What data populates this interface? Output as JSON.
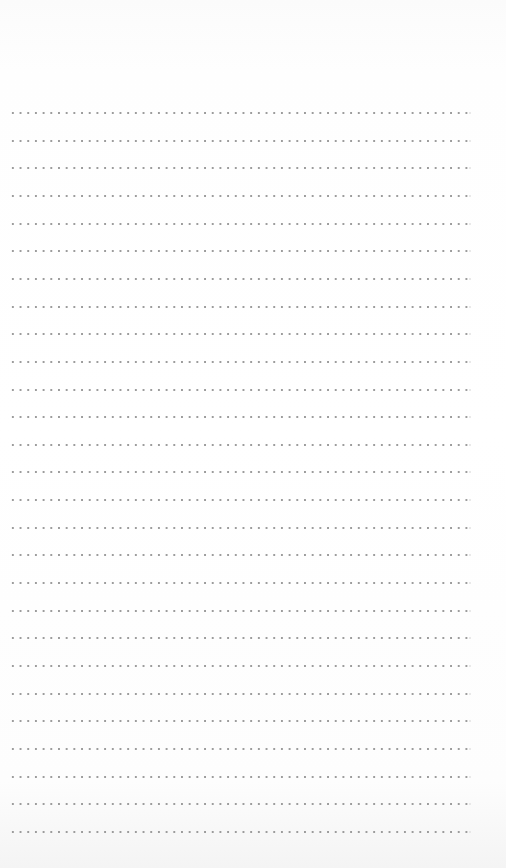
{
  "page": {
    "type": "dotted-ruled-notepad",
    "background_color": "#ffffff",
    "dot_color": "#9c9c9c",
    "line_count": 27,
    "first_line_y": 112,
    "line_spacing": 27.65,
    "line_left": 9,
    "line_width": 460,
    "header_text": "",
    "body_text": ""
  }
}
